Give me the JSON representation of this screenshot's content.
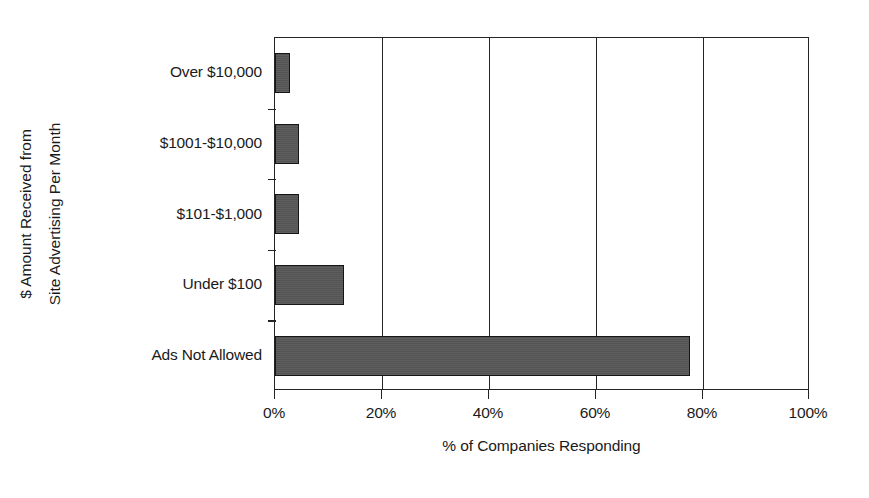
{
  "chart_data": {
    "type": "bar",
    "orientation": "horizontal",
    "title": "",
    "xlabel": "% of Companies Responding",
    "ylabel": "$ Amount Received from Site Advertising Per Month",
    "ylabel_line1": "$ Amount Received from",
    "ylabel_line2": "Site Advertising Per Month",
    "categories": [
      "Over $10,000",
      "$1001-$10,000",
      "$101-$1,000",
      "Under $100",
      "Ads Not Allowed"
    ],
    "values": [
      2.8,
      4.5,
      4.5,
      12.9,
      77.5
    ],
    "value_labels": [
      "2.8%",
      "4.5%",
      "4.5%",
      "12.9%",
      "77.5%"
    ],
    "xlim": [
      0,
      100
    ],
    "xticks": [
      0,
      20,
      40,
      60,
      80,
      100
    ],
    "xticklabels": [
      "0%",
      "20%",
      "40%",
      "60%",
      "80%",
      "100%"
    ],
    "grid": true,
    "grid_axis": "x",
    "legend": false,
    "colors": {
      "bar_fill": "#565656",
      "bar_edge": "#161616",
      "axis": "#242424",
      "text": "#1a1a1a",
      "background": "#ffffff"
    }
  }
}
